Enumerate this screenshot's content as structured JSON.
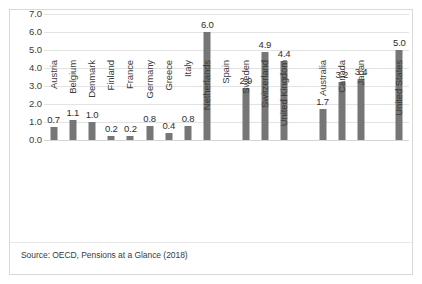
{
  "chart_data": {
    "type": "bar",
    "title": "",
    "subtitle": "",
    "xlabel": "",
    "ylabel": "",
    "ylim": [
      0.0,
      7.0
    ],
    "y_ticks": [
      "0.0",
      "1.0",
      "2.0",
      "3.0",
      "4.0",
      "5.0",
      "6.0",
      "7.0"
    ],
    "grid": true,
    "legend": "none",
    "bar_color": "#767676",
    "categories": [
      "Austria",
      "Belgium",
      "Denmark",
      "Finland",
      "France",
      "Germany",
      "Greece",
      "Italy",
      "Netherlands",
      "Spain",
      "Sweden",
      "Switzerland",
      "United Kingdom",
      "",
      "Australia",
      "Canada",
      "Japan",
      "",
      "United States"
    ],
    "values": [
      0.7,
      1.1,
      1.0,
      0.2,
      0.2,
      0.8,
      0.4,
      0.8,
      6.0,
      null,
      2.9,
      4.9,
      4.4,
      null,
      1.7,
      3.2,
      3.4,
      null,
      5.0
    ],
    "data_labels": [
      "0.7",
      "1.1",
      "1.0",
      "0.2",
      "0.2",
      "0.8",
      "0.4",
      "0.8",
      "6.0",
      "",
      "2.9",
      "4.9",
      "4.4",
      "",
      "1.7",
      "3.2",
      "3.4",
      "",
      "5.0"
    ],
    "annotations": []
  },
  "source": {
    "note": "Source: OECD, Pensions at a Glance (2018)"
  }
}
